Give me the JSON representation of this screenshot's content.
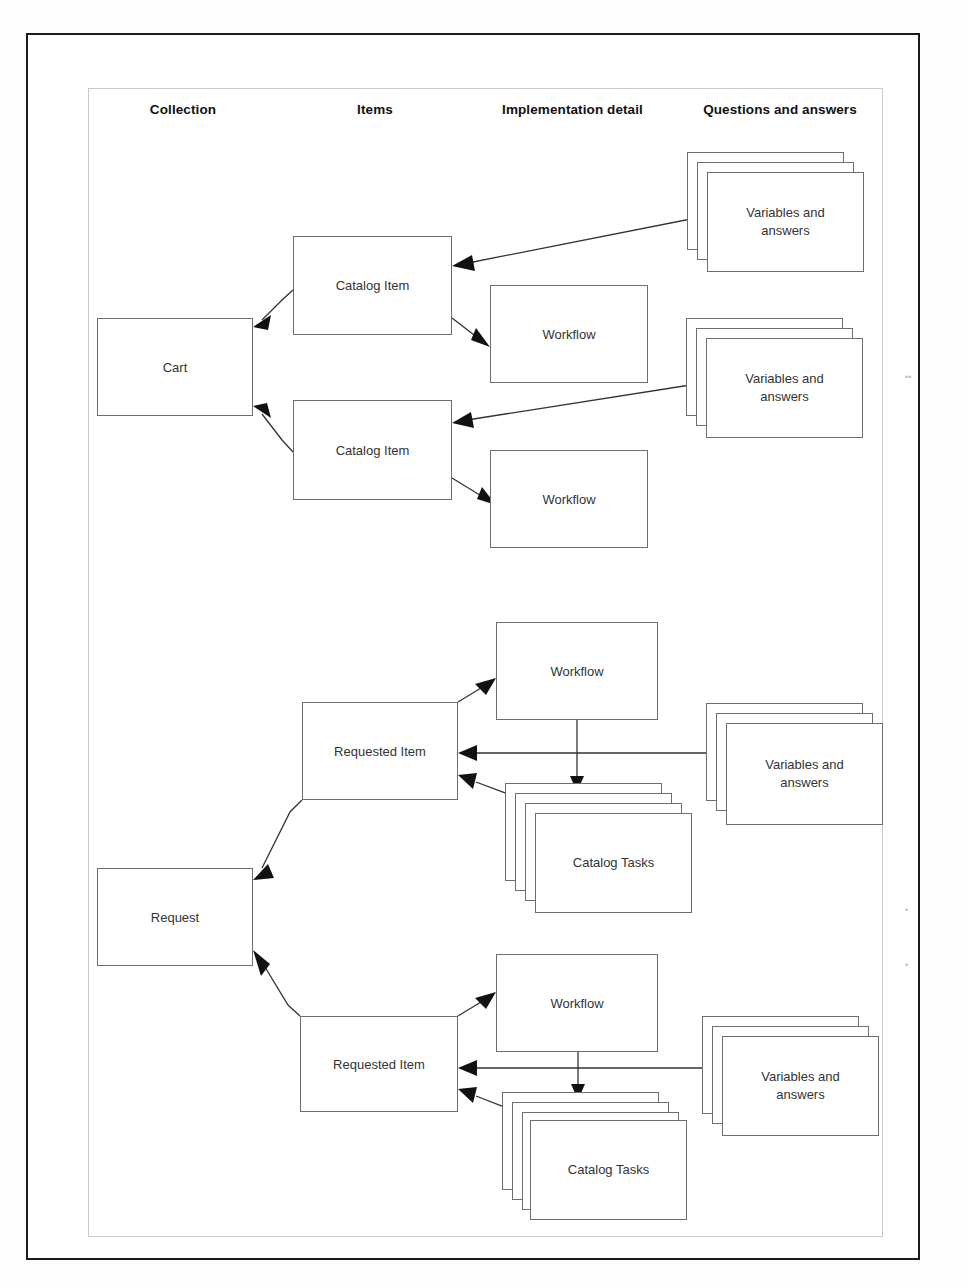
{
  "diagram": {
    "columns": [
      {
        "label": "Collection"
      },
      {
        "label": "Items"
      },
      {
        "label": "Implementation detail"
      },
      {
        "label": "Questions and answers"
      }
    ],
    "nodes": {
      "cart": "Cart",
      "catalog_item_1": "Catalog Item",
      "catalog_item_2": "Catalog Item",
      "workflow_1": "Workflow",
      "workflow_2": "Workflow",
      "variables_1": "Variables and answers",
      "variables_2": "Variables and answers",
      "request": "Request",
      "requested_item_1": "Requested Item",
      "requested_item_2": "Requested Item",
      "workflow_3": "Workflow",
      "workflow_4": "Workflow",
      "catalog_tasks_1": "Catalog Tasks",
      "catalog_tasks_2": "Catalog Tasks",
      "variables_3": "Variables and answers",
      "variables_4": "Variables and answers"
    },
    "edges": [
      {
        "from": "catalog_item_1",
        "to": "cart"
      },
      {
        "from": "catalog_item_2",
        "to": "cart"
      },
      {
        "from": "catalog_item_1",
        "to": "workflow_1"
      },
      {
        "from": "catalog_item_2",
        "to": "workflow_2"
      },
      {
        "from": "variables_1",
        "to": "catalog_item_1"
      },
      {
        "from": "variables_2",
        "to": "catalog_item_2"
      },
      {
        "from": "requested_item_1",
        "to": "request"
      },
      {
        "from": "requested_item_2",
        "to": "request"
      },
      {
        "from": "requested_item_1",
        "to": "workflow_3"
      },
      {
        "from": "requested_item_2",
        "to": "workflow_4"
      },
      {
        "from": "workflow_3",
        "to": "catalog_tasks_1"
      },
      {
        "from": "workflow_4",
        "to": "catalog_tasks_2"
      },
      {
        "from": "variables_3",
        "to": "requested_item_1"
      },
      {
        "from": "variables_4",
        "to": "requested_item_2"
      },
      {
        "from": "catalog_tasks_1",
        "to": "requested_item_1"
      },
      {
        "from": "catalog_tasks_2",
        "to": "requested_item_2"
      }
    ],
    "colors": {
      "frame": "#1b1b1b",
      "inner_frame": "#c9c9c9",
      "node_border": "#6e6e6e",
      "line": "#333333",
      "text": "#333333",
      "background": "#ffffff"
    }
  }
}
